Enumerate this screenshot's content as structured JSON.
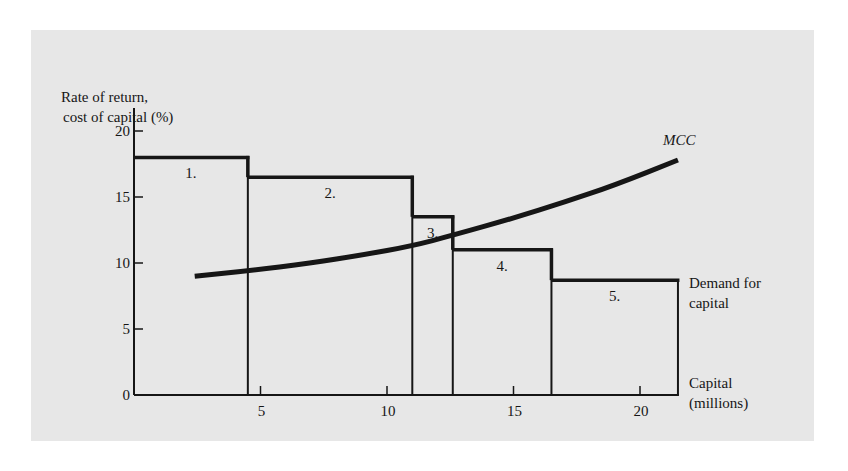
{
  "chart_data": {
    "type": "bar",
    "title": "",
    "ylabel_lines": [
      "Rate of return,",
      "cost of capital (%)"
    ],
    "xlabel_lines": [
      "Capital",
      "(millions)"
    ],
    "demand_label_lines": [
      "Demand for",
      "capital"
    ],
    "mcc_label": "MCC",
    "xlim": [
      0,
      22
    ],
    "ylim": [
      0,
      20
    ],
    "x_ticks": [
      5,
      10,
      15,
      20
    ],
    "y_ticks": [
      0,
      5,
      10,
      15,
      20
    ],
    "x_tick_labels": [
      "5",
      "10",
      "15",
      "20"
    ],
    "y_tick_labels": [
      "0",
      "5",
      "10",
      "15",
      "20"
    ],
    "grid": false,
    "series": [
      {
        "name": "Demand for capital",
        "kind": "step_bars",
        "projects": [
          {
            "label": "1.",
            "x_start": 0,
            "x_end": 4.5,
            "rate": 18.0
          },
          {
            "label": "2.",
            "x_start": 4.5,
            "x_end": 11.0,
            "rate": 16.5
          },
          {
            "label": "3.",
            "x_start": 11.0,
            "x_end": 12.6,
            "rate": 13.5
          },
          {
            "label": "4.",
            "x_start": 12.6,
            "x_end": 16.5,
            "rate": 11.0
          },
          {
            "label": "5.",
            "x_start": 16.5,
            "x_end": 21.5,
            "rate": 8.7
          }
        ]
      },
      {
        "name": "MCC",
        "kind": "curve",
        "x": [
          2.4,
          4.5,
          7.0,
          9.0,
          11.0,
          12.6,
          15.0,
          17.0,
          19.0,
          21.5
        ],
        "y": [
          9.0,
          9.4,
          10.0,
          10.6,
          11.3,
          12.1,
          13.4,
          14.6,
          15.9,
          17.8
        ]
      }
    ]
  },
  "labels": {
    "y_title_1": "Rate of return,",
    "y_title_2": "cost of capital (%)",
    "demand_1": "Demand for",
    "demand_2": "capital",
    "capital_1": "Capital",
    "capital_2": "(millions)",
    "mcc": "MCC"
  },
  "colors": {
    "background": "#e7e7e7",
    "ink": "#161616"
  }
}
